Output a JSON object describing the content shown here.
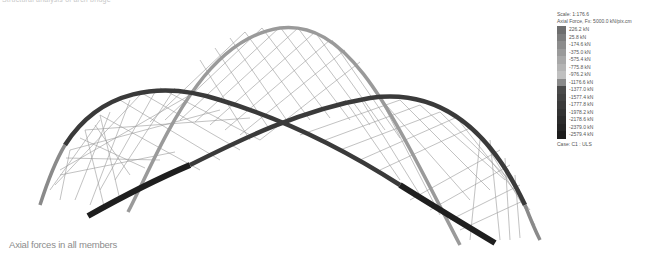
{
  "header": {
    "top_caption": "Structural analysis of arch bridge"
  },
  "caption": "Axial forces in all members",
  "legend": {
    "scale": "Scale: 1:176.6",
    "title": "Axial Force, Fx: 5000.0 kN/pix.cm",
    "entries": [
      {
        "label": "226.2 kN",
        "color": "#6e6e6e"
      },
      {
        "label": "25.8 kN",
        "color": "#7d7d7d"
      },
      {
        "label": "-174.6 kN",
        "color": "#8c8c8c"
      },
      {
        "label": "-375.0 kN",
        "color": "#9a9a9a"
      },
      {
        "label": "-575.4 kN",
        "color": "#a8a8a8"
      },
      {
        "label": "-775.8 kN",
        "color": "#b4b4b4"
      },
      {
        "label": "-976.2 kN",
        "color": "#c0c0c0"
      },
      {
        "label": "-1176.6 kN",
        "color": "#8a8a8a"
      },
      {
        "label": "-1377.0 kN",
        "color": "#4a4a4a"
      },
      {
        "label": "-1577.4 kN",
        "color": "#424242"
      },
      {
        "label": "-1777.8 kN",
        "color": "#3a3a3a"
      },
      {
        "label": "-1978.2 kN",
        "color": "#333333"
      },
      {
        "label": "-2178.6 kN",
        "color": "#2c2c2c"
      },
      {
        "label": "-2379.0 kN",
        "color": "#252525"
      },
      {
        "label": "-2579.4 kN",
        "color": "#1c1c1c"
      }
    ],
    "case": "Case: C1 : ULS"
  },
  "colors": {
    "grey_arch": "#9a9a9a",
    "dark_arch": "#3a3a3a",
    "darkest_segment": "#1e1e1e",
    "hangers": "#8f8f8f"
  }
}
